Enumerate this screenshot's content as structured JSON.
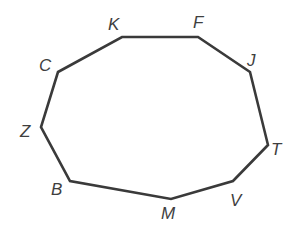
{
  "diagram": {
    "type": "polygon",
    "sides": 10,
    "stroke_color": "#3a3a3a",
    "label_color": "#3f3f3f",
    "vertices": [
      {
        "name": "K",
        "x": 122,
        "y": 37,
        "label_x": 108,
        "label_y": 30
      },
      {
        "name": "F",
        "x": 198,
        "y": 37,
        "label_x": 193,
        "label_y": 28
      },
      {
        "name": "J",
        "x": 250,
        "y": 72,
        "label_x": 247,
        "label_y": 66
      },
      {
        "name": "T",
        "x": 268,
        "y": 145,
        "label_x": 271,
        "label_y": 155
      },
      {
        "name": "V",
        "x": 233,
        "y": 181,
        "label_x": 230,
        "label_y": 206
      },
      {
        "name": "M",
        "x": 171,
        "y": 199,
        "label_x": 161,
        "label_y": 219
      },
      {
        "name": "B",
        "x": 70,
        "y": 181,
        "label_x": 51,
        "label_y": 195
      },
      {
        "name": "Z",
        "x": 41,
        "y": 127,
        "label_x": 20,
        "label_y": 137
      },
      {
        "name": "C",
        "x": 58,
        "y": 72,
        "label_x": 39,
        "label_y": 71
      }
    ]
  }
}
